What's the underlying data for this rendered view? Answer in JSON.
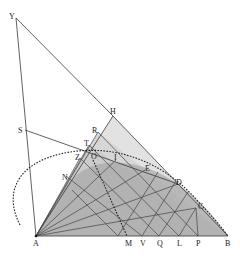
{
  "diagram": {
    "colors": {
      "background": "#ffffff",
      "light_triangle": "#e2e2e2",
      "mid_triangle": "#cdcdcd",
      "dark_region": "#a9a9a9",
      "line": "#3a3a3a"
    },
    "points": {
      "Y": {
        "label": "Y",
        "x": 16,
        "y": 18
      },
      "H": {
        "label": "H",
        "x": 113,
        "y": 116
      },
      "S": {
        "label": "S",
        "x": 25,
        "y": 130
      },
      "R": {
        "label": "R",
        "x": 98,
        "y": 132
      },
      "T": {
        "label": "T",
        "x": 89,
        "y": 145
      },
      "Z": {
        "label": "Z",
        "x": 80,
        "y": 158
      },
      "O": {
        "label": "O",
        "x": 93,
        "y": 160
      },
      "I": {
        "label": "I",
        "x": 116,
        "y": 160
      },
      "N": {
        "label": "N",
        "x": 66,
        "y": 176
      },
      "E": {
        "label": "E",
        "x": 145,
        "y": 170
      },
      "D": {
        "label": "D",
        "x": 178,
        "y": 184
      },
      "C": {
        "label": "C",
        "x": 196,
        "y": 208
      },
      "A": {
        "label": "A",
        "x": 36,
        "y": 236
      },
      "M": {
        "label": "M",
        "x": 127,
        "y": 236
      },
      "V": {
        "label": "V",
        "x": 142,
        "y": 236
      },
      "Q": {
        "label": "Q",
        "x": 159,
        "y": 236
      },
      "L": {
        "label": "L",
        "x": 179,
        "y": 236
      },
      "P": {
        "label": "P",
        "x": 198,
        "y": 236
      },
      "B": {
        "label": "B",
        "x": 228,
        "y": 236
      }
    }
  }
}
